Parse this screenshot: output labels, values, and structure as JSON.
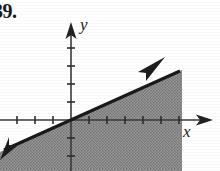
{
  "problem": {
    "number_label": "39."
  },
  "figure": {
    "name": "linear-inequality-graph",
    "axis_labels": {
      "x": "x",
      "y": "y"
    },
    "colors": {
      "ink": "#1d1d1d",
      "axis": "#3a3a3a",
      "shade_fill": "#8a8a8a",
      "page_background": "#ffffff"
    },
    "axes": {
      "x_axis": {
        "origin_px": [
          71,
          120
        ],
        "arrow_tip_px": [
          213,
          120
        ],
        "tick_spacing_px": 18,
        "tick_half_length_px": 4,
        "ticks_left_of_origin": 3,
        "ticks_right_of_origin": 6,
        "has_arrow_right": true,
        "has_arrow_left": false
      },
      "y_axis": {
        "origin_px": [
          71,
          120
        ],
        "arrow_tip_px": [
          71,
          22
        ],
        "tick_spacing_px": 18,
        "tick_half_length_px": 4,
        "ticks_above_origin": 4,
        "ticks_below_origin": 2,
        "has_arrow_up": true,
        "has_arrow_down": false
      }
    },
    "boundary_line": {
      "style": "solid",
      "thickness_px": 3,
      "slope_px": 0.45,
      "x_intercept_px": 26,
      "y_intercept_px": 140,
      "start_px": [
        2,
        151
      ],
      "end_px": [
        182,
        70
      ],
      "arrowheads": [
        "down-left",
        "up-right"
      ]
    },
    "shaded_region": {
      "side": "below-right",
      "description": "region below and to the right of the boundary line",
      "fill_pattern": "halftone-dither-gray",
      "bounds_px": {
        "left": 0,
        "top": 38,
        "right": 182,
        "bottom": 171
      }
    }
  }
}
